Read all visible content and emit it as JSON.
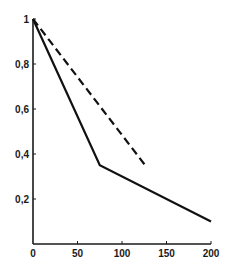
{
  "chart_data": {
    "type": "line",
    "title": "",
    "xlabel": "",
    "ylabel": "",
    "xlim": [
      0,
      200
    ],
    "ylim": [
      0,
      1
    ],
    "grid": false,
    "legend": null,
    "x_ticks": [
      0,
      50,
      100,
      150,
      200
    ],
    "x_tick_labels": [
      "0",
      "50",
      "100",
      "150",
      "200"
    ],
    "y_ticks": [
      0.2,
      0.4,
      0.6,
      0.8,
      1
    ],
    "y_tick_labels": [
      "0,2",
      "0,4",
      "0,6",
      "0,8",
      "1"
    ],
    "series": [
      {
        "name": "solid",
        "style": "solid",
        "color": "#111111",
        "points": [
          [
            0,
            1.0
          ],
          [
            75,
            0.35
          ],
          [
            200,
            0.1
          ]
        ]
      },
      {
        "name": "dashed",
        "style": "dashed",
        "color": "#111111",
        "points": [
          [
            0,
            1.0
          ],
          [
            128,
            0.34
          ]
        ]
      }
    ]
  },
  "layout": {
    "origin_px": [
      33,
      244
    ],
    "x_px_per_unit": 0.89,
    "y_px_per_unit": 225
  }
}
